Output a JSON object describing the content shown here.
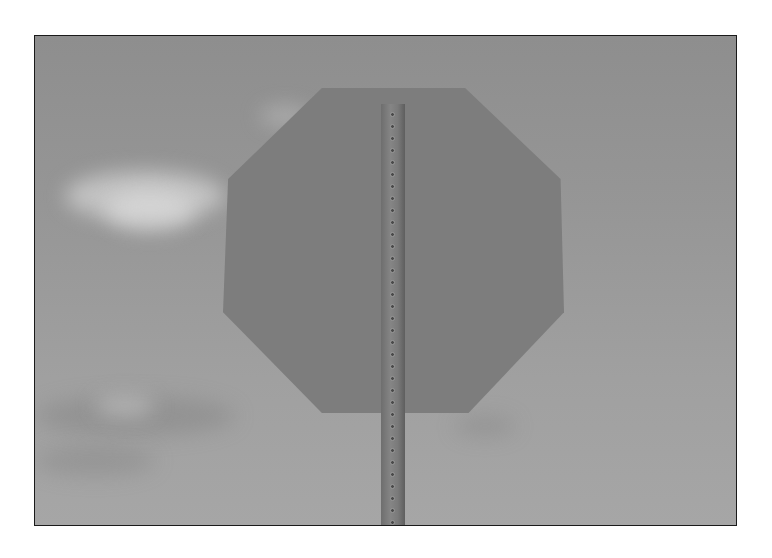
{
  "photo": {
    "subject": "back of octagonal stop sign on perforated metal post",
    "background": "overcast sky with light clouds",
    "colors": {
      "sky": "#969696",
      "sign": "#7d7d7d",
      "post": "#858585",
      "frame_border": "#1a1a1a"
    },
    "post_hole_count": 36
  }
}
